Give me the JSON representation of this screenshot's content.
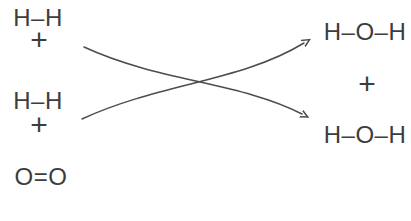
{
  "diagram": {
    "type": "chemical-reaction-structural-diagram"
  },
  "reactants": {
    "hydrogen1": "H–H",
    "plus1": "+",
    "hydrogen2": "H–H",
    "plus2": "+",
    "oxygen": "O=O"
  },
  "products": {
    "water1": "H–O–H",
    "plus": "+",
    "water2": "H–O–H"
  },
  "icons": {
    "arrows": "crossing-curved-arrows"
  },
  "colors": {
    "background": "#ffffff",
    "text": "#3d3d3d",
    "arrow": "#4d4d4d"
  }
}
